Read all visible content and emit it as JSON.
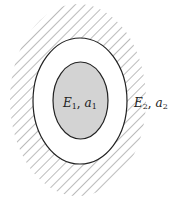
{
  "figure": {
    "inner_region": {
      "label_E": "E",
      "label_E_sub": "1",
      "label_sep": ", ",
      "label_a": "a",
      "label_a_sub": "1",
      "fill": "#d3d3d3"
    },
    "outer_region": {
      "label_E": "E",
      "label_E_sub": "2",
      "label_sep": ", ",
      "label_a": "a",
      "label_a_sub": "2",
      "hatch_color": "#777777"
    },
    "stroke_color": "#222222"
  }
}
